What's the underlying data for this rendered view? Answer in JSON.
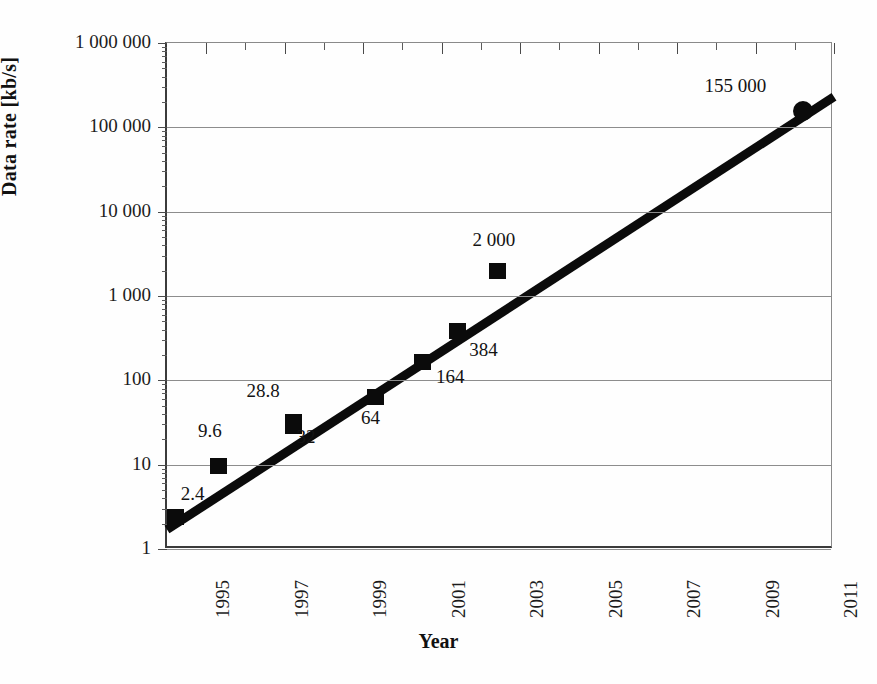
{
  "chart_data": {
    "type": "scatter",
    "title": "",
    "xlabel": "Year",
    "ylabel": "Data rate [kb/s]",
    "yscale": "log",
    "ylim": [
      1,
      1000000
    ],
    "xlim": [
      1994,
      2011
    ],
    "grid": true,
    "legend": "none",
    "y_tick_labels": [
      "1 000 000",
      "100 000",
      "10 000",
      "1 000",
      "100",
      "10",
      "1"
    ],
    "y_tick_values": [
      1000000,
      100000,
      10000,
      1000,
      100,
      10,
      1
    ],
    "x_tick_labels": [
      "1995",
      "1997",
      "1999",
      "2001",
      "2003",
      "2005",
      "2007",
      "2009",
      "2011"
    ],
    "x_tick_values": [
      1995,
      1997,
      1999,
      2001,
      2003,
      2005,
      2007,
      2009,
      2011
    ],
    "points": [
      {
        "label": "2.4",
        "x": 1994.2,
        "y": 2.4,
        "marker": "square",
        "label_dx": 8,
        "label_dy": -32
      },
      {
        "label": "9.6",
        "x": 1995.3,
        "y": 9.6,
        "marker": "square",
        "label_dx": -18,
        "label_dy": -44
      },
      {
        "label": "28.8",
        "x": 1997.2,
        "y": 28.8,
        "marker": "square",
        "label_dx": -44,
        "label_dy": -44
      },
      {
        "label": "32",
        "x": 1997.2,
        "y": 32,
        "marker": "square",
        "label_dx": 6,
        "label_dy": 6
      },
      {
        "label": "64",
        "x": 1999.3,
        "y": 64,
        "marker": "square",
        "label_dx": -12,
        "label_dy": 12
      },
      {
        "label": "164",
        "x": 2000.5,
        "y": 164,
        "marker": "square",
        "label_dx": 16,
        "label_dy": 6
      },
      {
        "label": "384",
        "x": 2001.4,
        "y": 384,
        "marker": "square",
        "label_dx": 14,
        "label_dy": 10
      },
      {
        "label": "2 000",
        "x": 2002.4,
        "y": 2000,
        "marker": "square",
        "label_dx": -22,
        "label_dy": -40
      },
      {
        "label": "155 000",
        "x": 2010.2,
        "y": 155000,
        "marker": "circle",
        "label_dx": -96,
        "label_dy": -34
      }
    ],
    "trendline": {
      "x_start": 1994.0,
      "y_start": 1.7,
      "x_end": 2011.0,
      "y_end": 230000,
      "width_px": 9,
      "color": "#0b0b0b"
    }
  }
}
